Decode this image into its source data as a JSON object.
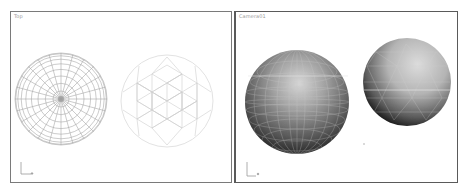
{
  "viewports": [
    {
      "name": "top-viewport",
      "label": "Top",
      "objects": [
        {
          "type": "sphere-wireframe",
          "view": "top",
          "center": [
            50,
            87
          ],
          "radius": 46
        },
        {
          "type": "geosphere-wireframe",
          "view": "top",
          "center": [
            156,
            89
          ],
          "radius": 46
        }
      ]
    },
    {
      "name": "camera-viewport",
      "label": "Camera01",
      "objects": [
        {
          "type": "sphere-shaded",
          "center": [
            61,
            90
          ],
          "radius": 52
        },
        {
          "type": "geosphere-shaded",
          "center": [
            171,
            70
          ],
          "radius": 44
        }
      ]
    }
  ],
  "colors": {
    "wire_dark": "#9a9a9a",
    "wire_light": "#d0d0d0",
    "border": "#6e6e6e",
    "label": "#9a9a9a"
  }
}
